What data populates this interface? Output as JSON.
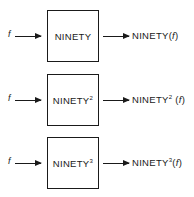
{
  "diagram": {
    "rows": [
      {
        "input": "f",
        "box_label": "NINETY",
        "box_exponent": "",
        "output_prefix": "NINETY",
        "output_exponent": "",
        "output_arg_open": "(",
        "output_arg": "f",
        "output_arg_close": ")"
      },
      {
        "input": "f",
        "box_label": "NINETY",
        "box_exponent": "2",
        "output_prefix": "NINETY",
        "output_exponent": "2",
        "output_arg_open": " (",
        "output_arg": "f",
        "output_arg_close": ")"
      },
      {
        "input": "f",
        "box_label": "NINETY",
        "box_exponent": "3",
        "output_prefix": "NINETY",
        "output_exponent": "3",
        "output_arg_open": "(",
        "output_arg": "f",
        "output_arg_close": ")"
      }
    ],
    "colors": {
      "stroke": "#1a1a1a",
      "background": "#ffffff"
    }
  }
}
